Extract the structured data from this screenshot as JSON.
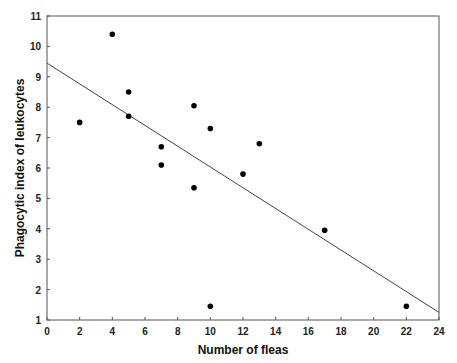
{
  "chart_data": {
    "type": "scatter",
    "title": "",
    "xlabel": "Number of fleas",
    "ylabel": "Phagocytic index of leukocytes",
    "xlim": [
      0,
      24
    ],
    "ylim": [
      1,
      11
    ],
    "xticks": [
      0,
      2,
      4,
      6,
      8,
      10,
      12,
      14,
      16,
      18,
      20,
      22,
      24
    ],
    "yticks": [
      1,
      2,
      3,
      4,
      5,
      6,
      7,
      8,
      9,
      10,
      11
    ],
    "grid": false,
    "legend": null,
    "series": [
      {
        "name": "observations",
        "marker": "filled-circle",
        "color": "#000000",
        "points": [
          {
            "x": 2,
            "y": 7.5
          },
          {
            "x": 4,
            "y": 10.4
          },
          {
            "x": 5,
            "y": 8.5
          },
          {
            "x": 5,
            "y": 7.7
          },
          {
            "x": 7,
            "y": 6.7
          },
          {
            "x": 7,
            "y": 6.1
          },
          {
            "x": 9,
            "y": 8.05
          },
          {
            "x": 9,
            "y": 5.35
          },
          {
            "x": 10,
            "y": 7.3
          },
          {
            "x": 10,
            "y": 1.45
          },
          {
            "x": 12,
            "y": 5.8
          },
          {
            "x": 13,
            "y": 6.8
          },
          {
            "x": 17,
            "y": 3.95
          },
          {
            "x": 22,
            "y": 1.45
          }
        ]
      }
    ],
    "fit_line": {
      "type": "linear",
      "color": "#444444",
      "x0": 0,
      "y0": 9.45,
      "x1": 24,
      "y1": 1.25
    }
  }
}
